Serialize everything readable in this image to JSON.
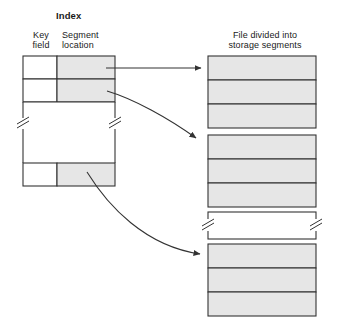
{
  "figure": {
    "type": "indexed-file-storage-diagram",
    "background": "#ffffff",
    "stroke_color": "#333333",
    "shade_color": "#e6e6e6",
    "white_fill": "#ffffff"
  },
  "index": {
    "title": "Index",
    "columns": [
      {
        "name": "key-field",
        "label_line1": "Key",
        "label_line2": "field"
      },
      {
        "name": "segment-location",
        "label_line1": "Segment",
        "label_line2": "location"
      }
    ],
    "rows": [
      {
        "key": "C",
        "location_value": "",
        "shaded": true
      },
      {
        "key": "F",
        "location_value": "",
        "shaded": true
      },
      {
        "key": "",
        "location_value": "",
        "shaded": false,
        "is_break": true
      },
      {
        "key": "Z",
        "location_value": "",
        "shaded": true
      }
    ],
    "break_symbol": "zigzag"
  },
  "file": {
    "title_line1": "File divided into",
    "title_line2": "storage segments",
    "groups": [
      {
        "name": "segment-group-abc",
        "segments": [
          {
            "label": "A"
          },
          {
            "label": "B"
          },
          {
            "label": "C"
          }
        ]
      },
      {
        "name": "segment-group-def",
        "segments": [
          {
            "label": "D"
          },
          {
            "label": "E"
          },
          {
            "label": "F"
          }
        ]
      },
      {
        "name": "segment-group-break",
        "is_break": true,
        "segments": []
      },
      {
        "name": "segment-group-xyz",
        "segments": [
          {
            "label": "X"
          },
          {
            "label": "Y"
          },
          {
            "label": "Z"
          }
        ]
      }
    ]
  },
  "pointers": [
    {
      "name": "pointer-c-to-a",
      "from_row": "C",
      "to_segment": "A",
      "style": "straight"
    },
    {
      "name": "pointer-f-to-d",
      "from_row": "F",
      "to_segment": "D",
      "style": "curved"
    },
    {
      "name": "pointer-z-to-x",
      "from_row": "Z",
      "to_segment": "X",
      "style": "curved"
    }
  ]
}
